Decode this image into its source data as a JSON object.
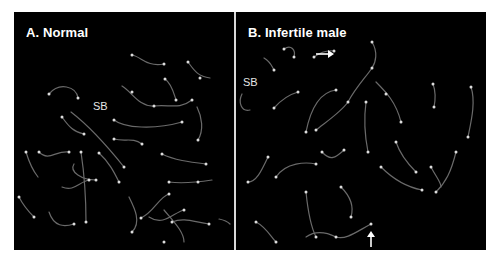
{
  "figure": {
    "panels": [
      {
        "id": "A",
        "title": "A. Normal",
        "annotations": [
          {
            "type": "label",
            "text": "SB"
          }
        ]
      },
      {
        "id": "B",
        "title": "B. Infertile male",
        "annotations": [
          {
            "type": "label",
            "text": "SB"
          },
          {
            "type": "arrow",
            "direction": "right"
          },
          {
            "type": "arrow",
            "direction": "up"
          }
        ]
      }
    ]
  },
  "colors": {
    "background": "#000000",
    "chromosome": "#8a8a8a",
    "focus": "#e0e0e0",
    "text": "#ffffff"
  }
}
